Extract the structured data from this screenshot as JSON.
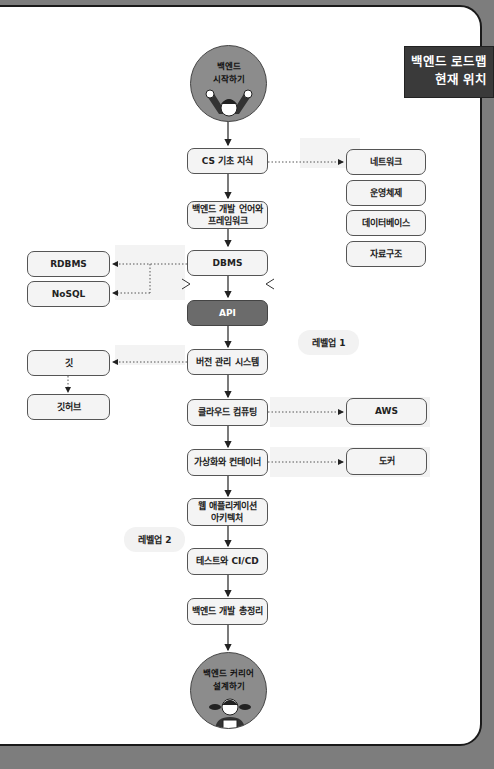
{
  "banner": {
    "line1": "백엔드 로드맵",
    "line2": "현재 위치"
  },
  "start": {
    "line1": "백엔드",
    "line2": "시작하기",
    "icon": "cheering-kid-icon"
  },
  "end": {
    "line1": "백엔드 커리어",
    "line2": "설계하기",
    "icon": "girl-with-book-icon"
  },
  "main_nodes": [
    {
      "id": "cs",
      "label": "CS 기초 지식"
    },
    {
      "id": "lang",
      "label": "백엔드 개발 언어와\n프레임워크"
    },
    {
      "id": "dbms",
      "label": "DBMS"
    },
    {
      "id": "api",
      "label": "API"
    },
    {
      "id": "vcs",
      "label": "버전 관리 시스템"
    },
    {
      "id": "cloud",
      "label": "클라우드 컴퓨팅"
    },
    {
      "id": "virt",
      "label": "가상화와 컨테이너"
    },
    {
      "id": "webarch",
      "label": "웹 애플리케이션\n아키텍처"
    },
    {
      "id": "test",
      "label": "테스트와 CI/CD"
    },
    {
      "id": "summary",
      "label": "백엔드 개발 총정리"
    }
  ],
  "side_nodes": {
    "cs": [
      "네트워크",
      "운영체제",
      "데이터베이스",
      "자료구조"
    ],
    "dbms": [
      "RDBMS",
      "NoSQL"
    ],
    "vcs": [
      "깃",
      "깃허브"
    ],
    "cloud": [
      "AWS"
    ],
    "virt": [
      "도커"
    ]
  },
  "levels": {
    "level1": "레벨업 1",
    "level2": "레벨업 2"
  },
  "colors": {
    "api_fill": "#6b6b6b",
    "circle_fill": "#8c8c8c",
    "banner_fill": "#3a3a3a",
    "node_fill": "#f4f4f4"
  }
}
